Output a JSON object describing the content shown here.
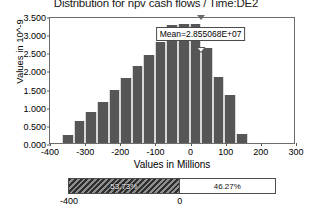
{
  "chart_data": {
    "type": "bar",
    "title": "Distribution for npv cash flows / Time:DE2",
    "xlabel": "Values in Millions",
    "ylabel": "Values in 10^-9",
    "xlim": [
      -400,
      300
    ],
    "ylim": [
      0.0,
      3.5
    ],
    "grid": false,
    "legend": "none",
    "xticks": [
      "-400",
      "-300",
      "-200",
      "-100",
      "0",
      "100",
      "200",
      "300"
    ],
    "xtick_values": [
      -400,
      -300,
      -200,
      -100,
      0,
      100,
      200,
      300
    ],
    "yticks": [
      "0.000",
      "0.500",
      "1.000",
      "1.500",
      "2.000",
      "2.500",
      "3.000",
      "3.500"
    ],
    "ytick_values": [
      0.0,
      0.5,
      1.0,
      1.5,
      2.0,
      2.5,
      3.0,
      3.5
    ],
    "bin_width": 33,
    "bins": [
      {
        "x_center": -349,
        "value": 0.21
      },
      {
        "x_center": -316,
        "value": 0.6
      },
      {
        "x_center": -283,
        "value": 0.85
      },
      {
        "x_center": -250,
        "value": 1.13
      },
      {
        "x_center": -217,
        "value": 1.47
      },
      {
        "x_center": -184,
        "value": 1.78
      },
      {
        "x_center": -151,
        "value": 2.12
      },
      {
        "x_center": -118,
        "value": 2.42
      },
      {
        "x_center": -85,
        "value": 2.78
      },
      {
        "x_center": -52,
        "value": 3.26
      },
      {
        "x_center": -19,
        "value": 3.29
      },
      {
        "x_center": 14,
        "value": 3.28
      },
      {
        "x_center": 47,
        "value": 2.62
      },
      {
        "x_center": 80,
        "value": 1.81
      },
      {
        "x_center": 113,
        "value": 1.33
      },
      {
        "x_center": 146,
        "value": 0.25
      }
    ],
    "annotations": [
      {
        "name": "mean-marker",
        "label": "Mean=2.855068E+07",
        "x_value": 28.55068,
        "marker": "triangle"
      }
    ],
    "percent_bar": {
      "left_label": "53.73%",
      "right_label": "46.27%",
      "left_fraction": 0.5373,
      "right_fraction": 0.4627,
      "left_endpoint": "-400",
      "divider_value": "0"
    }
  }
}
